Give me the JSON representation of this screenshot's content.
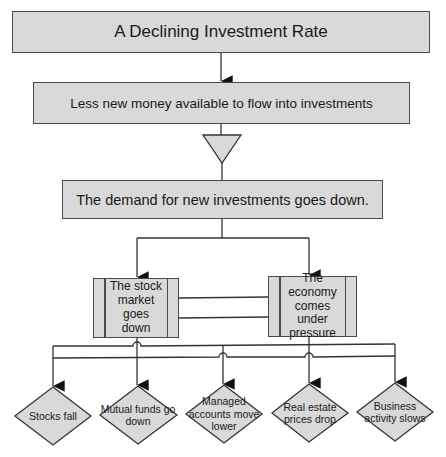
{
  "title": "A Declining Investment Rate",
  "steps": {
    "step1": "A Declining Investment Rate",
    "step2": "Less new money available to flow into investments",
    "step3": "The demand for new investments goes down."
  },
  "processes": {
    "left": "The stock market goes down",
    "right": "The economy comes under pressure"
  },
  "outcomes": [
    "Stocks fall",
    "Mutual funds go down",
    "Managed accounts move lower",
    "Real estate prices drop",
    "Business activity slows"
  ],
  "colors": {
    "fill": "#d9d9d9",
    "stroke": "#4a4a4a",
    "line": "#333333"
  }
}
